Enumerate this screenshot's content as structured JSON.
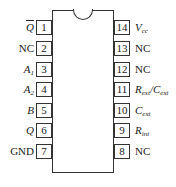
{
  "diagram": {
    "type": "ic-pinout",
    "package": "DIP-14",
    "left_pins": [
      {
        "number": "1",
        "label": "Q",
        "overline": true,
        "italic": true,
        "sub": ""
      },
      {
        "number": "2",
        "label": "NC",
        "overline": false,
        "italic": false,
        "sub": ""
      },
      {
        "number": "3",
        "label": "A",
        "overline": false,
        "italic": true,
        "sub": "1"
      },
      {
        "number": "4",
        "label": "A",
        "overline": false,
        "italic": true,
        "sub": "2"
      },
      {
        "number": "5",
        "label": "B",
        "overline": false,
        "italic": true,
        "sub": ""
      },
      {
        "number": "6",
        "label": "Q",
        "overline": false,
        "italic": true,
        "sub": ""
      },
      {
        "number": "7",
        "label": "GND",
        "overline": false,
        "italic": false,
        "sub": ""
      }
    ],
    "right_pins": [
      {
        "number": "14",
        "label": "V",
        "italic": true,
        "sub": "cc",
        "extra": ""
      },
      {
        "number": "13",
        "label": "NC",
        "italic": false,
        "sub": "",
        "extra": ""
      },
      {
        "number": "12",
        "label": "NC",
        "italic": false,
        "sub": "",
        "extra": ""
      },
      {
        "number": "11",
        "label": "R",
        "italic": true,
        "sub": "ext",
        "extra": "/C",
        "extra_sub": "ext"
      },
      {
        "number": "10",
        "label": "C",
        "italic": true,
        "sub": "ext",
        "extra": ""
      },
      {
        "number": "9",
        "label": "R",
        "italic": true,
        "sub": "int",
        "extra": ""
      },
      {
        "number": "8",
        "label": "NC",
        "italic": false,
        "sub": "",
        "extra": ""
      }
    ]
  }
}
